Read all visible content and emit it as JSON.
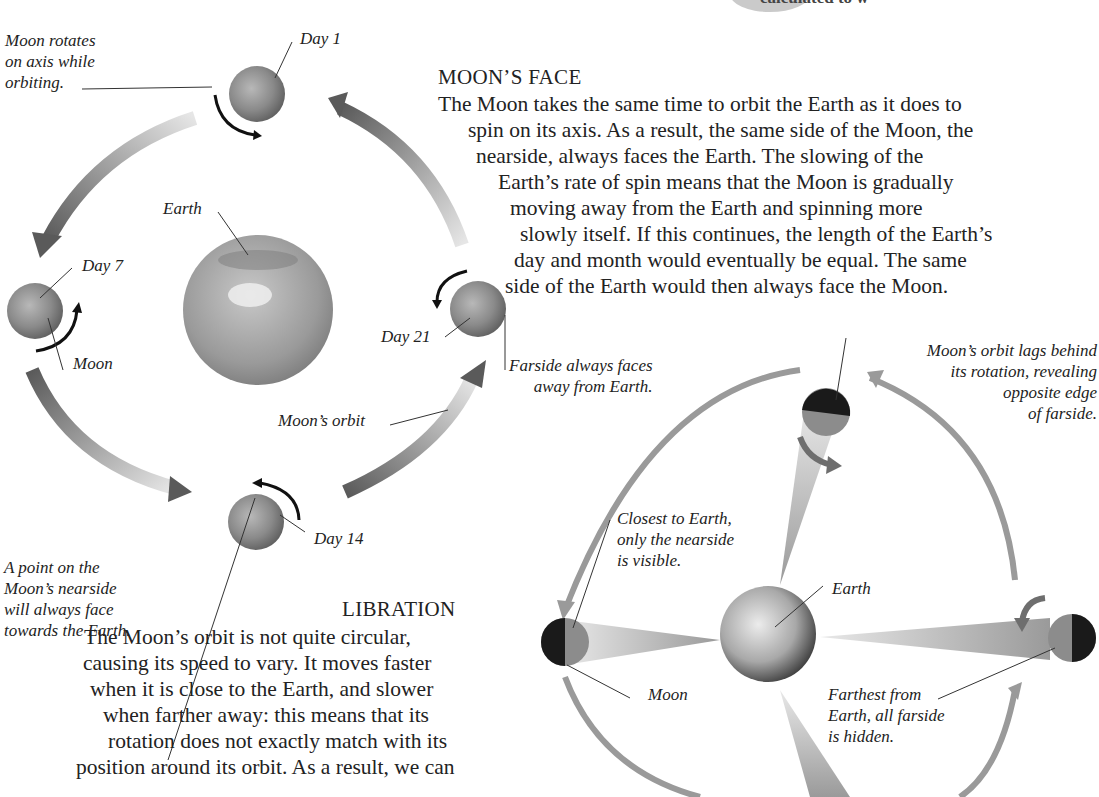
{
  "top_cutoff": {
    "text": "calculated to w"
  },
  "moons_face": {
    "heading": "MOON’S FACE",
    "lines": [
      "The Moon takes the same time to orbit the Earth as it does to",
      "spin on its axis. As a result, the same side of the Moon, the",
      "nearside, always faces the Earth. The slowing of the",
      "Earth’s rate of spin means that the Moon is gradually",
      "moving away from the Earth and spinning more",
      "slowly itself. If this continues, the length of the Earth’s",
      "day and month would eventually be equal. The same",
      "side of the Earth would then always face the Moon."
    ]
  },
  "libration": {
    "heading": "LIBRATION",
    "lines": [
      "The Moon’s orbit is not quite circular,",
      "causing its speed to vary. It moves faster",
      "when it is close to the Earth, and slower",
      "when farther away: this means that its",
      "rotation does not exactly match with its",
      "position around its orbit. As a result, we can"
    ]
  },
  "orbit_diagram": {
    "labels": {
      "rotates": [
        "Moon rotates",
        "on axis while",
        "orbiting."
      ],
      "day1": "Day 1",
      "earth": "Earth",
      "day7": "Day 7",
      "moon": "Moon",
      "day21": "Day 21",
      "farside": [
        "Farside always faces",
        "away from Earth."
      ],
      "orbit": "Moon’s orbit",
      "day14": "Day 14",
      "point": [
        "A point on the",
        "Moon’s nearside",
        "will always face",
        "towards the Earth."
      ]
    }
  },
  "libration_diagram": {
    "labels": {
      "lags": [
        "Moon’s orbit lags behind",
        "its rotation, revealing",
        "opposite edge",
        "of farside."
      ],
      "closest": [
        "Closest to Earth,",
        "only the nearside",
        "is visible."
      ],
      "earth": "Earth",
      "moon": "Moon",
      "farthest": [
        "Farthest from",
        "Earth, all farside",
        "is hidden."
      ]
    }
  },
  "colors": {
    "orbit_arrow_dark": "#5a5a5a",
    "orbit_arrow_light": "#d8d8d8",
    "libration_arrow": "#9a9a9a",
    "moon_gray": "#8c8c8c",
    "moon_dark": "#1a1a1a",
    "text": "#222222"
  }
}
